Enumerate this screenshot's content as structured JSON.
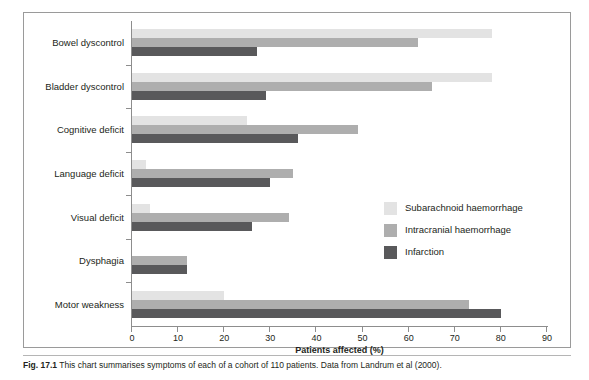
{
  "figure": {
    "caption_label": "Fig. 17.1",
    "caption_body": "This chart summarises symptoms of each of a cohort of 110 patients. Data from Landrum et al (2000)."
  },
  "chart_data": {
    "type": "bar",
    "orientation": "horizontal",
    "title": "",
    "xlabel": "Patients affected (%)",
    "ylabel": "",
    "xlim": [
      0,
      90
    ],
    "xticks": [
      0,
      10,
      20,
      30,
      40,
      50,
      60,
      70,
      80,
      90
    ],
    "grid": false,
    "legend_position": "center-right",
    "categories": [
      "Bowel dyscontrol",
      "Bladder dyscontrol",
      "Cognitive deficit",
      "Language deficit",
      "Visual deficit",
      "Dysphagia",
      "Motor weakness"
    ],
    "series": [
      {
        "name": "Subarachnoid haemorrhage",
        "color": "#e3e3e3",
        "values": [
          78,
          78,
          25,
          3,
          4,
          0,
          20
        ]
      },
      {
        "name": "Intracranial haemorrhage",
        "color": "#aeaeae",
        "values": [
          62,
          65,
          49,
          35,
          34,
          12,
          73
        ]
      },
      {
        "name": "Infarction",
        "color": "#59595b",
        "values": [
          27,
          29,
          36,
          30,
          26,
          12,
          80
        ]
      }
    ]
  }
}
